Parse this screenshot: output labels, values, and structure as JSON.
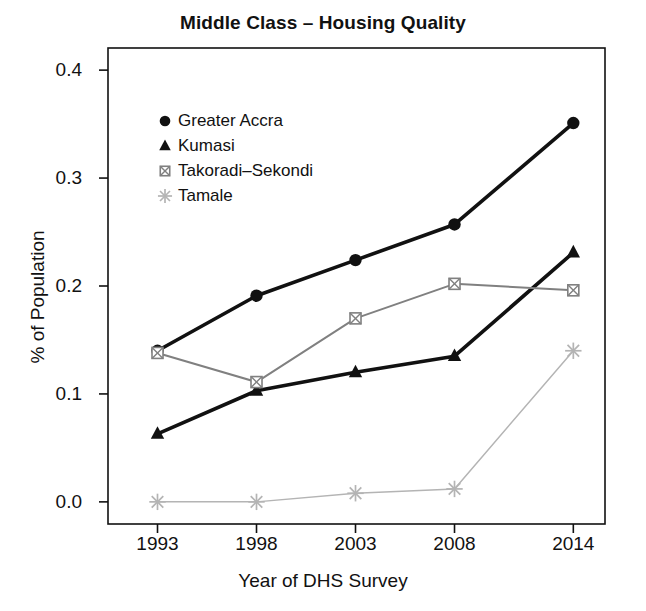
{
  "chart_data": {
    "type": "line",
    "title": "Middle Class – Housing Quality",
    "xlabel": "Year of DHS Survey",
    "ylabel": "% of Population",
    "categories": [
      "1993",
      "1998",
      "2003",
      "2008",
      "2014"
    ],
    "x": [
      1993,
      1998,
      2003,
      2008,
      2014
    ],
    "xlim": [
      1990.5,
      2015.6
    ],
    "ylim": [
      -0.0205,
      0.4205
    ],
    "yticks": [
      "0.0",
      "0.1",
      "0.2",
      "0.3",
      "0.4"
    ],
    "ytick_values": [
      0.0,
      0.1,
      0.2,
      0.3,
      0.4
    ],
    "xticks": [
      "1993",
      "1998",
      "2003",
      "2008",
      "2014"
    ],
    "grid": false,
    "legend_position": "upper-left-inside",
    "series": [
      {
        "name": "Greater Accra",
        "marker": "filled-circle",
        "color": "#111111",
        "values": [
          0.14,
          0.191,
          0.224,
          0.257,
          0.351
        ]
      },
      {
        "name": "Kumasi",
        "marker": "filled-triangle",
        "color": "#111111",
        "values": [
          0.063,
          0.103,
          0.12,
          0.135,
          0.231
        ]
      },
      {
        "name": "Takoradi–Sekondi",
        "marker": "square-with-x",
        "color": "#808080",
        "values": [
          0.138,
          0.111,
          0.17,
          0.202,
          0.196
        ]
      },
      {
        "name": "Tamale",
        "marker": "asterisk",
        "color": "#b4b4b4",
        "values": [
          0.0,
          0.0,
          0.008,
          0.012,
          0.14
        ]
      }
    ]
  },
  "legend": {
    "items": [
      {
        "label": "Greater Accra",
        "marker": "filled-circle"
      },
      {
        "label": "Kumasi",
        "marker": "filled-triangle"
      },
      {
        "label": "Takoradi–Sekondi",
        "marker": "square-with-x"
      },
      {
        "label": "Tamale",
        "marker": "asterisk"
      }
    ]
  },
  "colors": {
    "axis": "#111111",
    "accra": "#111111",
    "kumasi": "#111111",
    "takoradi": "#808080",
    "tamale": "#b4b4b4",
    "background": "#ffffff"
  }
}
